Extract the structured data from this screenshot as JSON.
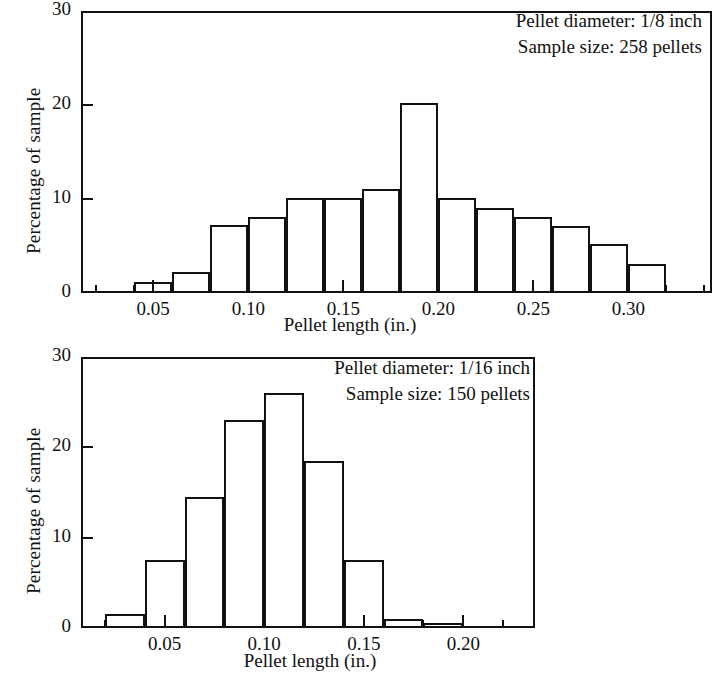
{
  "chart_data": [
    {
      "type": "bar",
      "title": "",
      "xlabel": "Pellet length (in.)",
      "ylabel": "Percentage of sample",
      "xlim": [
        0.012,
        0.344
      ],
      "ylim": [
        0,
        30
      ],
      "xticks_major": [
        0.05,
        0.1,
        0.15,
        0.2,
        0.25,
        0.3
      ],
      "xtick_labels": [
        "0.05",
        "0.10",
        "0.15",
        "0.20",
        "0.25",
        "0.30"
      ],
      "xticks_minor": [
        0.02,
        0.04,
        0.06,
        0.08,
        0.12,
        0.14,
        0.16,
        0.18,
        0.22,
        0.24,
        0.26,
        0.28,
        0.32,
        0.34
      ],
      "yticks": [
        0,
        10,
        20,
        30
      ],
      "ytick_labels": [
        "0",
        "10",
        "20",
        "30"
      ],
      "grid": false,
      "legend": "none",
      "bin_width": 0.02,
      "bin_edges": [
        0.04,
        0.06,
        0.08,
        0.1,
        0.12,
        0.14,
        0.16,
        0.18,
        0.2,
        0.22,
        0.24,
        0.26,
        0.28,
        0.3,
        0.32
      ],
      "categories": [
        "0.04-0.06",
        "0.06-0.08",
        "0.08-0.10",
        "0.10-0.12",
        "0.12-0.14",
        "0.14-0.16",
        "0.16-0.18",
        "0.18-0.20",
        "0.20-0.22",
        "0.22-0.24",
        "0.24-0.26",
        "0.26-0.28",
        "0.28-0.30",
        "0.30-0.32"
      ],
      "values": [
        1.2,
        2.2,
        7.2,
        8.1,
        10.1,
        10.1,
        11.1,
        20.2,
        10.1,
        9.0,
        8.1,
        7.1,
        5.2,
        3.1
      ],
      "annotations": [
        "Pellet diameter: 1/8 inch",
        "Sample size: 258 pellets"
      ]
    },
    {
      "type": "bar",
      "title": "",
      "xlabel": "Pellet length (in.)",
      "ylabel": "Percentage of sample",
      "xlim": [
        0.008,
        0.236
      ],
      "ylim": [
        0,
        30
      ],
      "xticks_major": [
        0.05,
        0.1,
        0.15,
        0.2
      ],
      "xtick_labels": [
        "0.05",
        "0.10",
        "0.15",
        "0.20"
      ],
      "xticks_minor": [
        0.02,
        0.04,
        0.06,
        0.08,
        0.12,
        0.14,
        0.16,
        0.18,
        0.22
      ],
      "yticks": [
        0,
        10,
        20,
        30
      ],
      "ytick_labels": [
        "0",
        "10",
        "20",
        "30"
      ],
      "grid": false,
      "legend": "none",
      "bin_width": 0.02,
      "bin_edges": [
        0.02,
        0.04,
        0.06,
        0.08,
        0.1,
        0.12,
        0.14,
        0.16,
        0.18,
        0.2
      ],
      "categories": [
        "0.02-0.04",
        "0.04-0.06",
        "0.06-0.08",
        "0.08-0.10",
        "0.10-0.12",
        "0.12-0.14",
        "0.14-0.16",
        "0.16-0.18",
        "0.18-0.20"
      ],
      "values": [
        1.5,
        7.5,
        14.5,
        23.0,
        26.0,
        18.5,
        7.5,
        1.0,
        0.5
      ],
      "annotations": [
        "Pellet diameter: 1/16 inch",
        "Sample size: 150 pellets"
      ]
    }
  ],
  "top": {
    "ylabel": "Percentage of sample",
    "xlabel": "Pellet length (in.)",
    "ytick_labels": [
      "30",
      "20",
      "10",
      "0"
    ],
    "xtick_labels": [
      "0.05",
      "0.10",
      "0.15",
      "0.20",
      "0.25",
      "0.30"
    ],
    "annotation_line1": "Pellet diameter: 1/8 inch",
    "annotation_line2": "Sample size: 258 pellets"
  },
  "bottom": {
    "ylabel": "Percentage of sample",
    "xlabel": "Pellet length (in.)",
    "ytick_labels": [
      "30",
      "20",
      "10",
      "0"
    ],
    "xtick_labels": [
      "0.05",
      "0.10",
      "0.15",
      "0.20"
    ],
    "annotation_line1": "Pellet diameter: 1/16 inch",
    "annotation_line2": "Sample size: 150 pellets"
  },
  "colors": {
    "ink": "#111111",
    "paper": "#ffffff"
  }
}
